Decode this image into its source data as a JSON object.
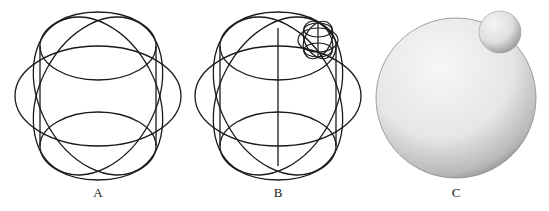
{
  "figure": {
    "panels": [
      {
        "id": "A",
        "label": "A",
        "description": "wireframe of large sphere built from interlocking ellipses"
      },
      {
        "id": "B",
        "label": "B",
        "description": "wireframe of large sphere with vertical axis and small wireframe sphere attached at upper right"
      },
      {
        "id": "C",
        "label": "C",
        "description": "shaded solid large sphere with small sphere at upper right"
      }
    ],
    "colors": {
      "stroke": "#1a1a1a",
      "background": "#ffffff",
      "sphere_light": "#f4f4f4",
      "sphere_dark": "#8a8a8a"
    }
  }
}
